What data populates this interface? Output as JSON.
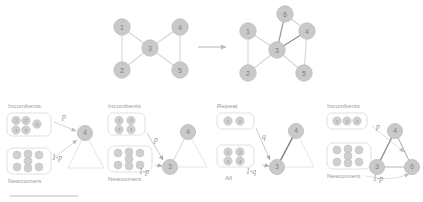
{
  "figure": {
    "title": "",
    "top_row": {
      "arrow": "right-arrow",
      "before": {
        "name": "bowtie-graph-before",
        "nodes": [
          {
            "id": "1",
            "label": "1",
            "x": 122,
            "y": 27
          },
          {
            "id": "2",
            "label": "2",
            "x": 122,
            "y": 70
          },
          {
            "id": "3",
            "label": "3",
            "x": 150,
            "y": 48
          },
          {
            "id": "4",
            "label": "4",
            "x": 180,
            "y": 27
          },
          {
            "id": "5",
            "label": "5",
            "x": 180,
            "y": 70
          }
        ],
        "edges": [
          {
            "from": "1",
            "to": "2",
            "style": "light"
          },
          {
            "from": "1",
            "to": "3",
            "style": "light"
          },
          {
            "from": "2",
            "to": "3",
            "style": "light"
          },
          {
            "from": "3",
            "to": "4",
            "style": "light"
          },
          {
            "from": "3",
            "to": "5",
            "style": "light"
          },
          {
            "from": "4",
            "to": "5",
            "style": "light"
          }
        ]
      },
      "after": {
        "name": "bowtie-graph-after",
        "nodes": [
          {
            "id": "1",
            "label": "1",
            "x": 248,
            "y": 31
          },
          {
            "id": "2",
            "label": "2",
            "x": 248,
            "y": 73
          },
          {
            "id": "3",
            "label": "3",
            "x": 277,
            "y": 50
          },
          {
            "id": "4",
            "label": "4",
            "x": 307,
            "y": 31
          },
          {
            "id": "5",
            "label": "5",
            "x": 304,
            "y": 73
          },
          {
            "id": "6",
            "label": "6",
            "x": 285,
            "y": 14
          }
        ],
        "edges": [
          {
            "from": "1",
            "to": "2",
            "style": "light"
          },
          {
            "from": "1",
            "to": "3",
            "style": "light"
          },
          {
            "from": "2",
            "to": "3",
            "style": "light"
          },
          {
            "from": "3",
            "to": "4",
            "style": "dark"
          },
          {
            "from": "3",
            "to": "5",
            "style": "light"
          },
          {
            "from": "4",
            "to": "5",
            "style": "light"
          },
          {
            "from": "3",
            "to": "6",
            "style": "dark"
          },
          {
            "from": "6",
            "to": "4",
            "style": "light"
          }
        ]
      }
    },
    "panels": [
      {
        "name": "panel-step-1",
        "source_top_label": "Incumbents",
        "source_bottom_label": "Newcomers",
        "prob_top": "p",
        "prob_bottom": "1-p",
        "top_pool_nodes": [
          "1",
          "2",
          "4",
          "3",
          "5"
        ],
        "top_pool_layout": "wide",
        "bottom_pool_count": 7,
        "graph_nodes": [
          {
            "id": "4",
            "label": "4",
            "x": 85,
            "y": 133,
            "style": "solid"
          }
        ],
        "ghost_nodes": [
          {
            "id": "3",
            "x": 68,
            "y": 168
          },
          {
            "id": "5",
            "x": 104,
            "y": 168
          }
        ]
      },
      {
        "name": "panel-step-2",
        "source_top_label": "Incumbents",
        "source_bottom_label": "Newcomers",
        "prob_top": "p",
        "prob_bottom": "1-p",
        "top_pool_nodes": [
          "1",
          "2",
          "3",
          "4"
        ],
        "top_pool_layout": "grid",
        "bottom_pool_count": 7,
        "graph_nodes": [
          {
            "id": "4",
            "label": "4",
            "x": 188,
            "y": 132,
            "style": "solid"
          },
          {
            "id": "3",
            "label": "3",
            "x": 170,
            "y": 167,
            "style": "solid"
          }
        ],
        "ghost_nodes": [
          {
            "id": "5",
            "x": 207,
            "y": 167
          }
        ]
      },
      {
        "name": "panel-step-3",
        "source_top_label": "Repeat",
        "source_bottom_label": "All",
        "prob_top": "q",
        "prob_bottom": "1-q",
        "top_pool_nodes": [
          "1",
          "2"
        ],
        "top_pool_layout": "row",
        "bottom_pool_nodes": [
          "1",
          "2",
          "3",
          "4"
        ],
        "bottom_pool_layout": "grid",
        "graph_nodes": [
          {
            "id": "4",
            "label": "4",
            "x": 296,
            "y": 131,
            "style": "solid"
          },
          {
            "id": "3",
            "label": "3",
            "x": 277,
            "y": 167,
            "style": "solid"
          }
        ],
        "ghost_nodes": [
          {
            "id": "5",
            "x": 314,
            "y": 167
          }
        ]
      },
      {
        "name": "panel-step-4",
        "source_top_label": "Incumbents",
        "source_bottom_label": "Newcomers",
        "prob_top": "p",
        "prob_bottom": "1-p",
        "top_pool_nodes": [
          "1",
          "2",
          "3"
        ],
        "top_pool_layout": "row",
        "bottom_pool_count": 7,
        "graph_nodes": [
          {
            "id": "4",
            "label": "4",
            "x": 395,
            "y": 131,
            "style": "solid"
          },
          {
            "id": "3",
            "label": "3",
            "x": 377,
            "y": 167,
            "style": "solid"
          },
          {
            "id": "6",
            "label": "6",
            "x": 412,
            "y": 167,
            "style": "solid"
          }
        ],
        "ghost_nodes": []
      }
    ],
    "colors": {
      "node_fill": "#c9c9c9",
      "node_stroke": "#bdbdbd",
      "node_text": "#7e7e7e",
      "edge_light": "#d6d6d6",
      "edge_dark": "#8f8f8f",
      "box_stroke": "#dcdcdc",
      "label_text": "#9a9a9a",
      "arrow": "#bcbcbc",
      "rule": "#d0d0d0"
    }
  }
}
